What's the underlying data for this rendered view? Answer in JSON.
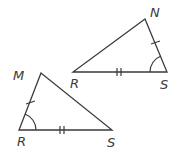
{
  "diagram": {
    "type": "congruent-triangles",
    "triangles": [
      {
        "id": "upper",
        "vertices": [
          {
            "label": "N",
            "x": 145,
            "y": 19,
            "label_x": 150,
            "label_y": 17
          },
          {
            "label": "R",
            "x": 73,
            "y": 72,
            "label_x": 70,
            "label_y": 88
          },
          {
            "label": "S",
            "x": 167,
            "y": 72,
            "label_x": 160,
            "label_y": 89
          }
        ],
        "marks": {
          "single_tick_side": "NS",
          "double_tick_side": "RS",
          "angle_arc_vertex": "S"
        }
      },
      {
        "id": "lower",
        "vertices": [
          {
            "label": "M",
            "x": 41,
            "y": 73,
            "label_x": 13,
            "label_y": 80
          },
          {
            "label": "R",
            "x": 19,
            "y": 130,
            "label_x": 17,
            "label_y": 146
          },
          {
            "label": "S",
            "x": 112,
            "y": 130,
            "label_x": 107,
            "label_y": 147
          }
        ],
        "marks": {
          "single_tick_side": "MR",
          "double_tick_side": "RS",
          "angle_arc_vertex": "R"
        }
      }
    ],
    "colors": {
      "stroke": "#3a3a3a",
      "background": "#ffffff"
    }
  }
}
